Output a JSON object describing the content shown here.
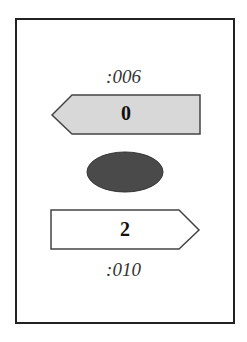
{
  "top_label": ":006",
  "top_box": {
    "value": "0",
    "direction": "left",
    "fill": "#d8d8d8"
  },
  "center_ellipse": {
    "fill": "#4a4a4a"
  },
  "bottom_box": {
    "value": "2",
    "direction": "right",
    "fill": "#ffffff"
  },
  "bottom_label": ":010"
}
